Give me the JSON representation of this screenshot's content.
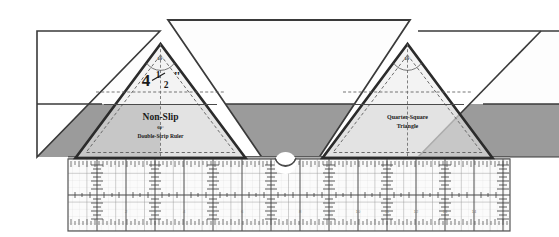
{
  "diagram": {
    "background_color": "#ffffff"
  },
  "fabric": {
    "top_strip": {
      "name": "light-fabric-strip",
      "color": "#fdfdfd",
      "edge_color": "#3a3a3a"
    },
    "bottom_strip": {
      "name": "dark-fabric-strip",
      "color": "#9b9b9b",
      "edge_color": "#3a3a3a"
    }
  },
  "rulers": [
    {
      "id": "left-ruler",
      "line1": "Non-Slip",
      "angle": "60°",
      "line2": "Double-Strip Ruler",
      "size_label": "4",
      "size_fraction_num": "1",
      "size_fraction_den": "2",
      "size_unit": "\"",
      "apex_angle": "60°",
      "body_color": "#d8d8d8",
      "outline_color": "#2b2b2b"
    },
    {
      "id": "right-ruler",
      "line1": "Quarter-Square",
      "line2": "Triangle",
      "apex_angle": "60°",
      "body_color": "#d8d8d8",
      "outline_color": "#2b2b2b"
    }
  ],
  "cutting_mat": {
    "name": "cutting-mat-grid",
    "fill": "#fbfbfb",
    "border_color": "#555555",
    "grid_color": "#8d8d8d",
    "tick_color": "#5a5a5a",
    "top_band_color": "#b0b0b0"
  },
  "notch": {
    "name": "center-notch-hole",
    "fill": "#ffffff",
    "stroke": "#4a4a4a"
  }
}
